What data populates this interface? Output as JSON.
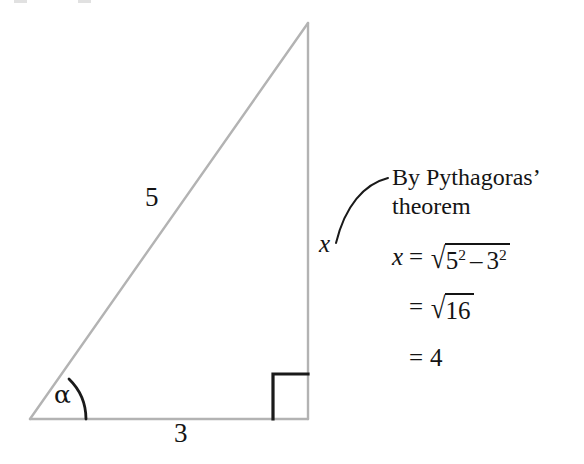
{
  "figure": {
    "type": "right-triangle-diagram",
    "colors": {
      "triangle_stroke": "#b3b3b3",
      "mark_stroke": "#1a1a1a",
      "text": "#141414",
      "background": "#ffffff"
    },
    "labels": {
      "hypotenuse": "5",
      "base": "3",
      "vertical_side": "x",
      "angle": "α"
    },
    "geometry": {
      "apex": [
        308,
        23
      ],
      "bottom_left": [
        30,
        419
      ],
      "bottom_right": [
        308,
        419
      ],
      "right_angle_box_size": 35,
      "angle_arc_radius": 56
    }
  },
  "annotation": {
    "line1": "By Pythagoras’",
    "line2": "theorem",
    "leader": "curved-leader-line"
  },
  "working": {
    "step1": {
      "lhs": "x",
      "equals": "=",
      "radicand_a": "5",
      "exp_a": "2",
      "operator": "–",
      "radicand_b": "3",
      "exp_b": "2",
      "radical": "√"
    },
    "step2": {
      "equals": "=",
      "radical": "√",
      "radicand": "16"
    },
    "step3": {
      "equals": "=",
      "value": "4"
    }
  }
}
